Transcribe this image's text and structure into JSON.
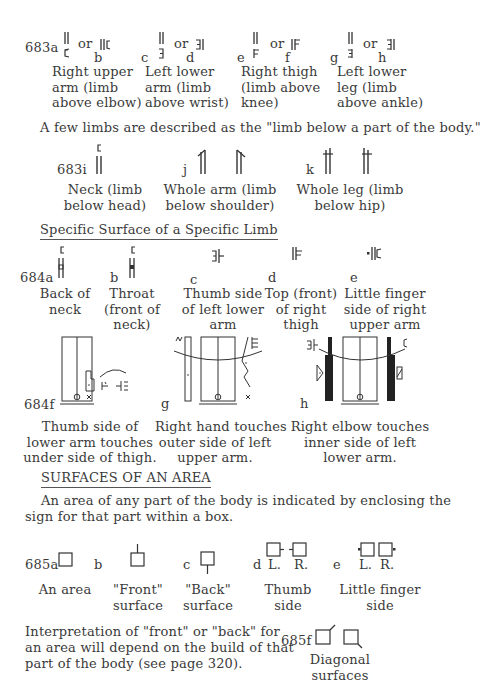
{
  "section_683": {
    "items": [
      {
        "label": "683a",
        "alt_label": "b",
        "or": "or",
        "caption": [
          "Right upper",
          "arm (limb",
          "above elbow)"
        ]
      },
      {
        "label": "c",
        "alt_label": "d",
        "or": "or",
        "caption": [
          "Left lower",
          "arm (limb",
          "above wrist)"
        ]
      },
      {
        "label": "e",
        "alt_label": "f",
        "or": "or",
        "caption": [
          "Right thigh",
          "(limb above",
          "knee)"
        ]
      },
      {
        "label": "g",
        "alt_label": "h",
        "or": "or",
        "caption": [
          "Left lower",
          "leg (limb",
          "above ankle)"
        ]
      }
    ],
    "intro": "A few limbs are described as the \"limb below a part of the body.\"",
    "below_items": [
      {
        "label": "683i",
        "caption": [
          "Neck (limb",
          "below head)"
        ]
      },
      {
        "label": "j",
        "caption": [
          "Whole arm (limb",
          "below shoulder)"
        ]
      },
      {
        "label": "k",
        "caption": [
          "Whole leg (limb",
          "below hip)"
        ]
      }
    ]
  },
  "section_684": {
    "heading": "Specific Surface of a Specific Limb",
    "items": [
      {
        "label": "684a",
        "caption": [
          "Back of",
          "neck"
        ]
      },
      {
        "label": "b",
        "caption": [
          "Throat",
          "(front of",
          "neck)"
        ]
      },
      {
        "label": "c",
        "caption": [
          "Thumb side",
          "of left lower",
          "arm"
        ]
      },
      {
        "label": "d",
        "caption": [
          "Top (front)",
          "of right",
          "thigh"
        ]
      },
      {
        "label": "e",
        "caption": [
          "Little finger",
          "side of right",
          "upper arm"
        ]
      }
    ],
    "diagrams": [
      {
        "label": "684f",
        "caption": [
          "Thumb side of",
          "lower arm touches",
          "under side of thigh."
        ]
      },
      {
        "label": "g",
        "caption": [
          "Right hand touches",
          "outer side of left",
          "upper arm."
        ]
      },
      {
        "label": "h",
        "caption": [
          "Right elbow touches",
          "inner side of left",
          "lower arm."
        ]
      }
    ]
  },
  "section_685": {
    "heading": "SURFACES OF AN AREA",
    "paragraph": [
      "An area of any part of the body is indicated by enclosing the",
      "sign for that part within a box."
    ],
    "items": [
      {
        "label": "685a",
        "caption": [
          "An area"
        ]
      },
      {
        "label": "b",
        "caption": [
          "\"Front\"",
          "surface"
        ]
      },
      {
        "label": "c",
        "caption": [
          "\"Back\"",
          "surface"
        ]
      },
      {
        "label": "d",
        "sub": [
          "L.",
          "R."
        ],
        "caption": [
          "Thumb",
          "side"
        ]
      },
      {
        "label": "e",
        "sub": [
          "L.",
          "R."
        ],
        "caption": [
          "Little finger",
          "side"
        ]
      }
    ],
    "note": [
      "Interpretation of \"front\" or \"back\" for",
      "an area will depend on the build of that",
      "part of the body (see page 320)."
    ],
    "diagonal": {
      "label": "685f",
      "caption": [
        "Diagonal",
        "surfaces"
      ]
    }
  }
}
